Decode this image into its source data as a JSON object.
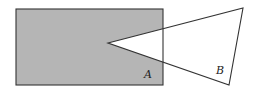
{
  "figure": {
    "width": 253,
    "height": 95,
    "background": "#ffffff",
    "rectangle": {
      "label": "A",
      "x": 16,
      "y": 9,
      "width": 147,
      "height": 76,
      "fill": "#b5b5b5",
      "stroke": "#333333"
    },
    "triangle": {
      "label": "B",
      "points": [
        [
          108,
          43
        ],
        [
          243,
          8
        ],
        [
          229,
          85
        ]
      ],
      "fill": "#ffffff",
      "stroke": "#333333"
    },
    "labels": {
      "A": {
        "text": "A",
        "x": 144,
        "y": 78
      },
      "B": {
        "text": "B",
        "x": 216,
        "y": 74
      }
    }
  }
}
